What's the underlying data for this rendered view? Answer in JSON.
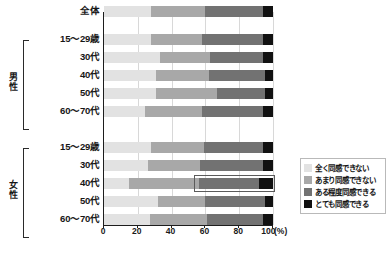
{
  "chart_data": {
    "type": "bar",
    "subtype": "stacked-horizontal-100pct",
    "title": "",
    "xlabel": "(%)",
    "ylabel": "",
    "xlim": [
      0,
      100
    ],
    "xticks": [
      "0",
      "20",
      "40",
      "60",
      "80",
      "100"
    ],
    "xtick_values": [
      0,
      20,
      40,
      60,
      80,
      100
    ],
    "grid": true,
    "legend_position": "right-bottom",
    "unit_label": "100 (%)",
    "categories": [
      "全体",
      "15〜29歳",
      "30代",
      "40代",
      "50代",
      "60〜70代",
      "15〜29歳",
      "30代",
      "40代",
      "50代",
      "60〜70代"
    ],
    "groups": [
      {
        "name": "",
        "label": "",
        "start": 0,
        "count": 1
      },
      {
        "name": "男性",
        "label": "男性",
        "start": 1,
        "count": 5
      },
      {
        "name": "女性",
        "label": "女性",
        "start": 6,
        "count": 5
      }
    ],
    "series": [
      {
        "name": "全く同感できない",
        "color": "#e2e2e2",
        "values": [
          28,
          28,
          33,
          31,
          31,
          24,
          28,
          26,
          15,
          32,
          27
        ]
      },
      {
        "name": "あまり同感できない",
        "color": "#a8a8a8",
        "values": [
          32,
          30,
          30,
          31,
          36,
          34,
          31,
          31,
          41,
          28,
          34
        ]
      },
      {
        "name": "ある程度同感できる",
        "color": "#727272",
        "values": [
          34,
          36,
          31,
          33,
          28,
          36,
          35,
          37,
          36,
          35,
          33
        ]
      },
      {
        "name": "とても同感できる",
        "color": "#111111",
        "values": [
          6,
          6,
          6,
          5,
          5,
          6,
          6,
          6,
          8,
          5,
          6
        ]
      }
    ],
    "highlight": {
      "row_index": 8,
      "row_label": "女性 40代",
      "from_pct": 55,
      "to_pct": 100,
      "border_color": "#5b5b5b"
    }
  },
  "legend": {
    "items": [
      {
        "label": "全く同感できない",
        "color": "#e2e2e2"
      },
      {
        "label": "あまり同感できない",
        "color": "#a8a8a8"
      },
      {
        "label": "ある程度同感できる",
        "color": "#727272"
      },
      {
        "label": "とても同感できる",
        "color": "#111111"
      }
    ]
  }
}
